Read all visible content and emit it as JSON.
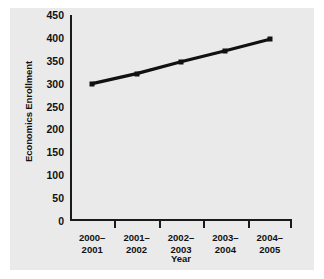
{
  "chart_data": {
    "type": "line",
    "title": "",
    "xlabel": "Year",
    "ylabel": "Economics Enrollment",
    "categories": [
      "2000–\n2001",
      "2001–\n2002",
      "2002–\n2003",
      "2003–\n2004",
      "2004–\n2005"
    ],
    "category_lines": [
      [
        "2000–",
        "2001"
      ],
      [
        "2001–",
        "2002"
      ],
      [
        "2002–",
        "2003"
      ],
      [
        "2003–",
        "2004"
      ],
      [
        "2004–",
        "2005"
      ]
    ],
    "values": [
      300,
      322,
      348,
      372,
      397
    ],
    "ylim": [
      0,
      450
    ],
    "yticks": [
      0,
      50,
      100,
      150,
      200,
      250,
      300,
      350,
      400,
      450
    ],
    "ytick_labels": [
      "0",
      "50",
      "100",
      "150",
      "200",
      "250",
      "300",
      "350",
      "400",
      "450"
    ],
    "grid": false,
    "legend": "none",
    "marker": "square",
    "line_color": "#111111",
    "marker_color": "#111111",
    "panel_color": "#eaeaea",
    "text_color": "#111111"
  }
}
